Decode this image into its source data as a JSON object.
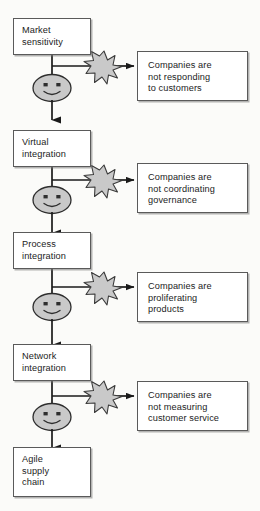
{
  "diagram": {
    "type": "flow-diagram",
    "colors": {
      "box_border": "#5a5a5a",
      "box_fill": "#ffffff",
      "burst_fill": "#c9c9c9",
      "burst_stroke": "#3a3a3a",
      "face_fill": "#c9c9c9",
      "face_stroke": "#2e2e2e",
      "line": "#1a1a1a",
      "background": "#fbfbf9"
    },
    "stages": [
      {
        "id": "market-sensitivity",
        "label": "Market\nsensitivity",
        "x": 13,
        "y": 18,
        "w": 78,
        "h": 37
      },
      {
        "id": "virtual-integration",
        "label": "Virtual\nintegration",
        "x": 13,
        "y": 130,
        "w": 78,
        "h": 37
      },
      {
        "id": "process-integration",
        "label": "Process\nintegration",
        "x": 13,
        "y": 232,
        "w": 78,
        "h": 37
      },
      {
        "id": "network-integration",
        "label": "Network\nintegration",
        "x": 13,
        "y": 344,
        "w": 78,
        "h": 37
      },
      {
        "id": "agile-supply-chain",
        "label": "Agile\nsupply\nchain",
        "x": 13,
        "y": 447,
        "w": 78,
        "h": 50
      }
    ],
    "issues": [
      {
        "id": "not-responding-to-customers",
        "label": "Companies are\nnot responding\nto customers",
        "x": 137,
        "y": 51,
        "w": 111,
        "h": 50
      },
      {
        "id": "not-coordinating-governance",
        "label": "Companies are\nnot coordinating\ngovernance",
        "x": 137,
        "y": 163,
        "w": 111,
        "h": 50
      },
      {
        "id": "proliferating-products",
        "label": "Companies are\nproliferating\nproducts",
        "x": 137,
        "y": 272,
        "w": 111,
        "h": 50
      },
      {
        "id": "not-measuring-customer-service",
        "label": "Companies are\nnot measuring\ncustomer service",
        "x": 137,
        "y": 381,
        "w": 111,
        "h": 50
      }
    ],
    "connectors": [
      {
        "id": "branch-1",
        "burst_cx": 104,
        "burst_cy": 66,
        "branch_y": 66,
        "face_cy": 88
      },
      {
        "id": "branch-2",
        "burst_cx": 104,
        "burst_cy": 180,
        "branch_y": 180,
        "face_cy": 200
      },
      {
        "id": "branch-3",
        "burst_cx": 104,
        "burst_cy": 287,
        "branch_y": 287,
        "face_cy": 307
      },
      {
        "id": "branch-4",
        "burst_cx": 104,
        "burst_cy": 396,
        "branch_y": 396,
        "face_cy": 417
      }
    ],
    "icons": {
      "burst": "starburst-icon",
      "face": "smiley-face-icon",
      "arrow": "arrowhead-icon"
    }
  }
}
